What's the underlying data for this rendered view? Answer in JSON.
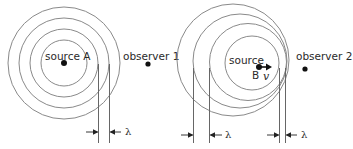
{
  "diagram": {
    "left": {
      "source_label": "source A",
      "observer_label": "observer 1",
      "wavelength_label": "λ"
    },
    "right": {
      "source_label_line1": "source",
      "source_label_line2": "B",
      "velocity_label": "v",
      "observer_label": "observer 2",
      "wavelength_label_left": "λ",
      "wavelength_label_right": "λ"
    },
    "colors": {
      "line": "#8a8a8a",
      "dot": "#111111",
      "text": "#2a2a2a"
    }
  }
}
